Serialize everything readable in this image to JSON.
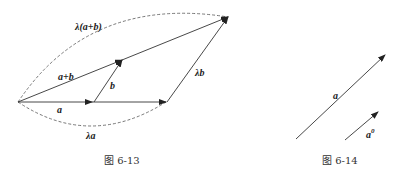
{
  "figures": [
    {
      "caption": "图 6-13",
      "labels": {
        "lambda_a_plus_b": "λ(a+b)",
        "a_plus_b": "a+b",
        "b": "b",
        "lambda_b": "λb",
        "a": "a",
        "lambda_a": "λa"
      }
    },
    {
      "caption": "图 6-14",
      "labels": {
        "a": "a",
        "a0": "a",
        "a0_sup": "0"
      }
    }
  ],
  "colors": {
    "line": "#333333",
    "background": "#ffffff"
  }
}
